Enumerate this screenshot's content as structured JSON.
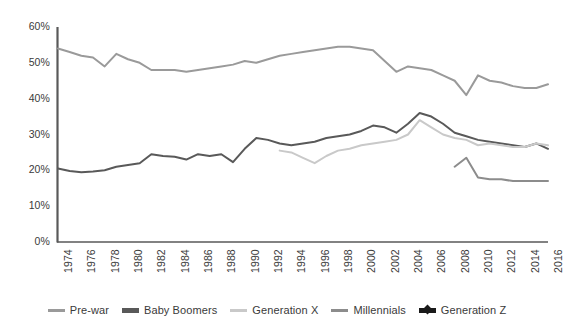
{
  "chart_data": {
    "type": "line",
    "title": "",
    "subtitle": "",
    "xlabel": "",
    "ylabel": "",
    "xlim": [
      1974,
      2016
    ],
    "ylim": [
      0,
      60
    ],
    "grid": false,
    "legend_position": "bottom",
    "x_tick_labels": [
      "1974",
      "1976",
      "1978",
      "1980",
      "1982",
      "1984",
      "1986",
      "1988",
      "1990",
      "1992",
      "1994",
      "1996",
      "1998",
      "2000",
      "2002",
      "2004",
      "2006",
      "2008",
      "2010",
      "2012",
      "2014",
      "2016"
    ],
    "y_tick_labels": [
      "0%",
      "10%",
      "20%",
      "30%",
      "40%",
      "50%",
      "60%"
    ],
    "y_tick_values": [
      0,
      10,
      20,
      30,
      40,
      50,
      60
    ],
    "x": [
      1974,
      1975,
      1976,
      1977,
      1978,
      1979,
      1980,
      1981,
      1982,
      1983,
      1984,
      1985,
      1986,
      1987,
      1988,
      1989,
      1990,
      1991,
      1992,
      1993,
      1994,
      1995,
      1996,
      1997,
      1998,
      1999,
      2000,
      2001,
      2002,
      2003,
      2004,
      2005,
      2006,
      2007,
      2008,
      2009,
      2010,
      2011,
      2012,
      2013,
      2014,
      2015,
      2016
    ],
    "series": [
      {
        "name": "Pre-war",
        "color": "#9a9a9a",
        "width": 2,
        "start_year": 1974,
        "values": [
          54,
          53,
          52,
          51.5,
          49,
          52.5,
          51,
          50,
          48,
          48,
          48,
          47.5,
          48,
          48.5,
          49,
          49.5,
          50.5,
          50,
          51,
          52,
          52.5,
          53,
          53.5,
          54,
          54.5,
          54.5,
          54,
          53.5,
          50.5,
          47.5,
          49,
          48.5,
          48,
          46.5,
          45,
          41,
          46.5,
          45,
          44.5,
          43.5,
          43,
          43,
          44
        ]
      },
      {
        "name": "Baby Boomers",
        "color": "#595959",
        "width": 2,
        "start_year": 1974,
        "values": [
          20.5,
          19.8,
          19.5,
          19.7,
          20,
          21,
          21.5,
          22,
          24.5,
          24,
          23.8,
          23,
          24.5,
          24,
          24.5,
          22.3,
          26,
          29,
          28.5,
          27.5,
          27,
          27.5,
          28,
          29,
          29.5,
          30,
          31,
          32.5,
          32,
          30.5,
          33,
          36,
          35,
          33,
          30.5,
          29.5,
          28.5,
          28,
          27.5,
          27,
          26.5,
          27.5,
          26
        ]
      },
      {
        "name": "Generation X",
        "color": "#c9c9c9",
        "width": 2,
        "start_year": 1993,
        "values": [
          null,
          null,
          null,
          null,
          null,
          null,
          null,
          null,
          null,
          null,
          null,
          null,
          null,
          null,
          null,
          null,
          null,
          null,
          null,
          25.5,
          25,
          23.5,
          22,
          24,
          25.5,
          26,
          27,
          27.5,
          28,
          28.5,
          30,
          34,
          32,
          30,
          29,
          28.5,
          27,
          27.5,
          27,
          26.5,
          26.5,
          27.5,
          27
        ]
      },
      {
        "name": "Millennials",
        "color": "#8c8c8c",
        "width": 2,
        "start_year": 2008,
        "values": [
          null,
          null,
          null,
          null,
          null,
          null,
          null,
          null,
          null,
          null,
          null,
          null,
          null,
          null,
          null,
          null,
          null,
          null,
          null,
          null,
          null,
          null,
          null,
          null,
          null,
          null,
          null,
          null,
          null,
          null,
          null,
          null,
          null,
          null,
          21,
          23.5,
          18,
          17.5,
          17.5,
          17,
          17,
          17,
          17
        ]
      },
      {
        "name": "Generation Z",
        "color": "#1a1a1a",
        "width": 3,
        "start_year": null,
        "values": [
          null,
          null,
          null,
          null,
          null,
          null,
          null,
          null,
          null,
          null,
          null,
          null,
          null,
          null,
          null,
          null,
          null,
          null,
          null,
          null,
          null,
          null,
          null,
          null,
          null,
          null,
          null,
          null,
          null,
          null,
          null,
          null,
          null,
          null,
          null,
          null,
          null,
          null,
          null,
          null,
          null,
          null,
          null
        ]
      }
    ]
  },
  "legend": {
    "items": [
      {
        "label": "Pre-war",
        "color": "#9a9a9a",
        "style": "line"
      },
      {
        "label": "Baby Boomers",
        "color": "#595959",
        "style": "line-thick"
      },
      {
        "label": "Generation X",
        "color": "#c9c9c9",
        "style": "line"
      },
      {
        "label": "Millennials",
        "color": "#8c8c8c",
        "style": "line"
      },
      {
        "label": "Generation Z",
        "color": "#1a1a1a",
        "style": "line-marker"
      }
    ]
  },
  "axes": {
    "axis_color": "#595959"
  }
}
